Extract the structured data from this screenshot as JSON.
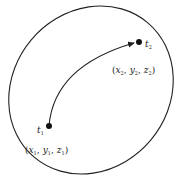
{
  "diagram": {
    "points": [
      {
        "id": "t1",
        "label": "t",
        "label_sub": "1",
        "coord": {
          "x": "x",
          "xs": "1",
          "y": "y",
          "ys": "1",
          "z": "z",
          "zs": "1"
        }
      },
      {
        "id": "t2",
        "label": "t",
        "label_sub": "2",
        "coord": {
          "x": "x",
          "xs": "2",
          "y": "y",
          "ys": "2",
          "z": "z",
          "zs": "2"
        }
      }
    ],
    "punct": {
      "open": "(",
      "close": ")",
      "sep": ","
    },
    "colors": {
      "stroke": "#222222",
      "background": "#ffffff"
    }
  }
}
